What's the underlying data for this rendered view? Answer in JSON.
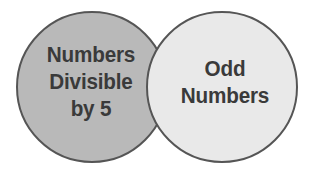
{
  "diagram": {
    "type": "venn-two-set",
    "background_color": "#ffffff",
    "sets": [
      {
        "id": "left",
        "name": "numbers-divisible-by-5",
        "label_lines": [
          "Numbers",
          "Divisible",
          "by 5"
        ],
        "fill_color": "#b9b9b9",
        "stroke_color": "#555555",
        "center_x": 92,
        "center_y": 87,
        "radius": 75
      },
      {
        "id": "right",
        "name": "odd-numbers",
        "label_lines": [
          "Odd",
          "Numbers"
        ],
        "fill_color": "#e9e9e9",
        "stroke_color": "#555555",
        "center_x": 222,
        "center_y": 87,
        "radius": 75
      }
    ],
    "intersection": {
      "fill_color": "#e2e2e2",
      "label": ""
    },
    "text_color": "#3a3a3a"
  }
}
